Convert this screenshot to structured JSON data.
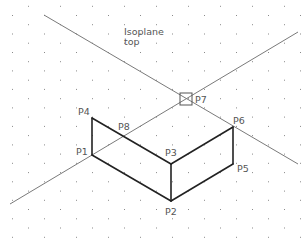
{
  "drawing": {
    "title_line1": "Isoplane",
    "title_line2": "top",
    "background": "#ffffff",
    "grid": {
      "type": "isometric-dot-grid",
      "dx": 16,
      "dy": 9.24,
      "origin_x": 12,
      "origin_y": 15,
      "dot_color": "#8a8a8a"
    },
    "construction_lines": [
      {
        "name": "diagonal-rising",
        "x1": 10,
        "y1": 204,
        "x2": 298,
        "y2": 32,
        "color": "#7a7a7a"
      },
      {
        "name": "diagonal-falling",
        "x1": 44,
        "y1": 15,
        "x2": 298,
        "y2": 164,
        "color": "#7a7a7a"
      }
    ],
    "points": [
      {
        "id": "P1",
        "label": "P1",
        "x": 92,
        "y": 155,
        "lx": 76,
        "ly": 155
      },
      {
        "id": "P2",
        "label": "P2",
        "x": 171,
        "y": 201,
        "lx": 165,
        "ly": 215
      },
      {
        "id": "P3",
        "label": "P3",
        "x": 171,
        "y": 164,
        "lx": 165,
        "ly": 156
      },
      {
        "id": "P4",
        "label": "P4",
        "x": 92,
        "y": 118,
        "lx": 78,
        "ly": 115
      },
      {
        "id": "P5",
        "label": "P5",
        "x": 233,
        "y": 164,
        "lx": 237,
        "ly": 172
      },
      {
        "id": "P6",
        "label": "P6",
        "x": 233,
        "y": 127,
        "lx": 233,
        "ly": 124
      },
      {
        "id": "P7",
        "label": "P7",
        "x": 186,
        "y": 99,
        "lx": 195,
        "ly": 103
      },
      {
        "id": "P8",
        "label": "P8",
        "x": 123,
        "y": 136,
        "lx": 118,
        "ly": 130
      }
    ],
    "shape_edges": [
      [
        "P4",
        "P1"
      ],
      [
        "P1",
        "P2"
      ],
      [
        "P2",
        "P3"
      ],
      [
        "P3",
        "P4"
      ],
      [
        "P2",
        "P5"
      ],
      [
        "P5",
        "P6"
      ],
      [
        "P6",
        "P3"
      ]
    ],
    "shape_color": "#222222",
    "marker": {
      "point": "P7",
      "type": "box-cross",
      "size": 12
    }
  }
}
